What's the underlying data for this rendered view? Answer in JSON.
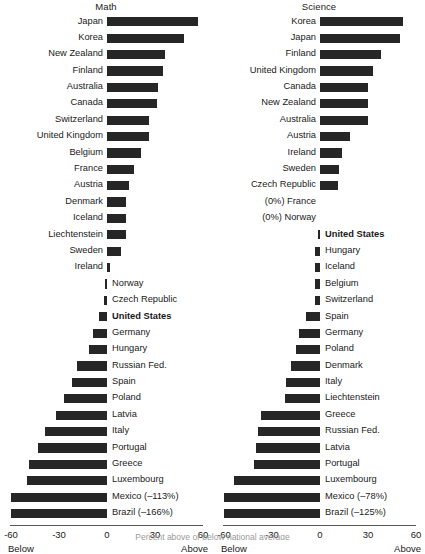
{
  "figure": {
    "width": 425,
    "height": 540,
    "bar_color": "#262626",
    "caption": "Percent above or below national average"
  },
  "axis": {
    "ticks": [
      "-60",
      "-30",
      "0",
      "30",
      "60"
    ],
    "tick_values": [
      -60,
      -30,
      0,
      30,
      60
    ],
    "left_end_label": "Below",
    "right_end_label": "Above",
    "min": -60,
    "max": 60
  },
  "panels": [
    {
      "title": "Math",
      "rows": [
        {
          "label": "Japan",
          "value": 57,
          "side": "left",
          "bold": false
        },
        {
          "label": "Korea",
          "value": 48,
          "side": "left",
          "bold": false
        },
        {
          "label": "New Zealand",
          "value": 36,
          "side": "left",
          "bold": false
        },
        {
          "label": "Finland",
          "value": 35,
          "side": "left",
          "bold": false
        },
        {
          "label": "Australia",
          "value": 32,
          "side": "left",
          "bold": false
        },
        {
          "label": "Canada",
          "value": 31,
          "side": "left",
          "bold": false
        },
        {
          "label": "Switzerland",
          "value": 26,
          "side": "left",
          "bold": false
        },
        {
          "label": "United Kingdom",
          "value": 26,
          "side": "left",
          "bold": false
        },
        {
          "label": "Belgium",
          "value": 21,
          "side": "left",
          "bold": false
        },
        {
          "label": "France",
          "value": 17,
          "side": "left",
          "bold": false
        },
        {
          "label": "Austria",
          "value": 14,
          "side": "left",
          "bold": false
        },
        {
          "label": "Denmark",
          "value": 12,
          "side": "left",
          "bold": false
        },
        {
          "label": "Iceland",
          "value": 12,
          "side": "left",
          "bold": false
        },
        {
          "label": "Liechtenstein",
          "value": 12,
          "side": "left",
          "bold": false
        },
        {
          "label": "Sweden",
          "value": 9,
          "side": "left",
          "bold": false
        },
        {
          "label": "Ireland",
          "value": 2,
          "side": "left",
          "bold": false
        },
        {
          "label": "Norway",
          "value": -1,
          "side": "right",
          "bold": false
        },
        {
          "label": "Czech Republic",
          "value": -2,
          "side": "right",
          "bold": false
        },
        {
          "label": "United States",
          "value": -5,
          "side": "right",
          "bold": true
        },
        {
          "label": "Germany",
          "value": -9,
          "side": "right",
          "bold": false
        },
        {
          "label": "Hungary",
          "value": -11,
          "side": "right",
          "bold": false
        },
        {
          "label": "Russian Fed.",
          "value": -19,
          "side": "right",
          "bold": false
        },
        {
          "label": "Spain",
          "value": -22,
          "side": "right",
          "bold": false
        },
        {
          "label": "Poland",
          "value": -27,
          "side": "right",
          "bold": false
        },
        {
          "label": "Latvia",
          "value": -32,
          "side": "right",
          "bold": false
        },
        {
          "label": "Italy",
          "value": -39,
          "side": "right",
          "bold": false
        },
        {
          "label": "Portugal",
          "value": -43,
          "side": "right",
          "bold": false
        },
        {
          "label": "Greece",
          "value": -49,
          "side": "right",
          "bold": false
        },
        {
          "label": "Luxembourg",
          "value": -50,
          "side": "right",
          "bold": false
        },
        {
          "label": "Mexico (–113%)",
          "value": -60,
          "side": "right",
          "bold": false,
          "clipped": true
        },
        {
          "label": "Brazil (–166%)",
          "value": -60,
          "side": "right",
          "bold": false,
          "clipped": true
        }
      ]
    },
    {
      "title": "Science",
      "rows": [
        {
          "label": "Korea",
          "value": 52,
          "side": "left",
          "bold": false
        },
        {
          "label": "Japan",
          "value": 50,
          "side": "left",
          "bold": false
        },
        {
          "label": "Finland",
          "value": 38,
          "side": "left",
          "bold": false
        },
        {
          "label": "United Kingdom",
          "value": 33,
          "side": "left",
          "bold": false
        },
        {
          "label": "Canada",
          "value": 30,
          "side": "left",
          "bold": false
        },
        {
          "label": "New Zealand",
          "value": 30,
          "side": "left",
          "bold": false
        },
        {
          "label": "Australia",
          "value": 30,
          "side": "left",
          "bold": false
        },
        {
          "label": "Austria",
          "value": 19,
          "side": "left",
          "bold": false
        },
        {
          "label": "Ireland",
          "value": 14,
          "side": "left",
          "bold": false
        },
        {
          "label": "Sweden",
          "value": 12,
          "side": "left",
          "bold": false
        },
        {
          "label": "Czech Republic",
          "value": 11,
          "side": "left",
          "bold": false
        },
        {
          "label": "(0%) France",
          "value": 0,
          "side": "left",
          "bold": false
        },
        {
          "label": "(0%) Norway",
          "value": 0,
          "side": "left",
          "bold": false
        },
        {
          "label": "United States",
          "value": -1,
          "side": "right",
          "bold": true
        },
        {
          "label": "Hungary",
          "value": -3,
          "side": "right",
          "bold": false
        },
        {
          "label": "Iceland",
          "value": -3,
          "side": "right",
          "bold": false
        },
        {
          "label": "Belgium",
          "value": -3,
          "side": "right",
          "bold": false
        },
        {
          "label": "Switzerland",
          "value": -3,
          "side": "right",
          "bold": false
        },
        {
          "label": "Spain",
          "value": -9,
          "side": "right",
          "bold": false
        },
        {
          "label": "Germany",
          "value": -13,
          "side": "right",
          "bold": false
        },
        {
          "label": "Poland",
          "value": -15,
          "side": "right",
          "bold": false
        },
        {
          "label": "Denmark",
          "value": -18,
          "side": "right",
          "bold": false
        },
        {
          "label": "Italy",
          "value": -21,
          "side": "right",
          "bold": false
        },
        {
          "label": "Liechtenstein",
          "value": -22,
          "side": "right",
          "bold": false
        },
        {
          "label": "Greece",
          "value": -37,
          "side": "right",
          "bold": false
        },
        {
          "label": "Russian Fed.",
          "value": -39,
          "side": "right",
          "bold": false
        },
        {
          "label": "Latvia",
          "value": -40,
          "side": "right",
          "bold": false
        },
        {
          "label": "Portugal",
          "value": -41,
          "side": "right",
          "bold": false
        },
        {
          "label": "Luxembourg",
          "value": -54,
          "side": "right",
          "bold": false
        },
        {
          "label": "Mexico (–78%)",
          "value": -60,
          "side": "right",
          "bold": false,
          "clipped": true
        },
        {
          "label": "Brazil (–125%)",
          "value": -60,
          "side": "right",
          "bold": false,
          "clipped": true
        }
      ]
    }
  ],
  "chart_data": {
    "type": "bar",
    "orientation": "horizontal",
    "xlabel": "Percent below / above",
    "ylabel": "",
    "xlim": [
      -60,
      60
    ],
    "grid": false,
    "legend": "none",
    "axis_end_labels": {
      "left": "Below",
      "right": "Above"
    },
    "panels": [
      {
        "title": "Math",
        "categories": [
          "Japan",
          "Korea",
          "New Zealand",
          "Finland",
          "Australia",
          "Canada",
          "Switzerland",
          "United Kingdom",
          "Belgium",
          "France",
          "Austria",
          "Denmark",
          "Iceland",
          "Liechtenstein",
          "Sweden",
          "Ireland",
          "Norway",
          "Czech Republic",
          "United States",
          "Germany",
          "Hungary",
          "Russian Fed.",
          "Spain",
          "Poland",
          "Latvia",
          "Italy",
          "Portugal",
          "Greece",
          "Luxembourg",
          "Mexico",
          "Brazil"
        ],
        "values": [
          57,
          48,
          36,
          35,
          32,
          31,
          26,
          26,
          21,
          17,
          14,
          12,
          12,
          12,
          9,
          2,
          -1,
          -2,
          -5,
          -9,
          -11,
          -19,
          -22,
          -27,
          -32,
          -39,
          -43,
          -49,
          -50,
          -113,
          -166
        ],
        "highlighted": [
          "United States"
        ],
        "clipped_labels": {
          "Mexico": "–113%",
          "Brazil": "–166%"
        }
      },
      {
        "title": "Science",
        "categories": [
          "Korea",
          "Japan",
          "Finland",
          "United Kingdom",
          "Canada",
          "New Zealand",
          "Australia",
          "Austria",
          "Ireland",
          "Sweden",
          "Czech Republic",
          "France",
          "Norway",
          "United States",
          "Hungary",
          "Iceland",
          "Belgium",
          "Switzerland",
          "Spain",
          "Germany",
          "Poland",
          "Denmark",
          "Italy",
          "Liechtenstein",
          "Greece",
          "Russian Fed.",
          "Latvia",
          "Portugal",
          "Luxembourg",
          "Mexico",
          "Brazil"
        ],
        "values": [
          52,
          50,
          38,
          33,
          30,
          30,
          30,
          19,
          14,
          12,
          11,
          0,
          0,
          -1,
          -3,
          -3,
          -3,
          -3,
          -9,
          -13,
          -15,
          -18,
          -21,
          -22,
          -37,
          -39,
          -40,
          -41,
          -54,
          -78,
          -125
        ],
        "highlighted": [
          "United States"
        ],
        "zero_labels": {
          "France": "(0%)",
          "Norway": "(0%)"
        },
        "clipped_labels": {
          "Mexico": "–78%",
          "Brazil": "–125%"
        }
      }
    ]
  }
}
